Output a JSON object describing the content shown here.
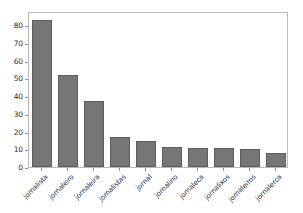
{
  "chart_data": {
    "type": "bar",
    "title": "",
    "subtitle": "",
    "xlabel": "",
    "ylabel": "",
    "categories": [
      "jornalista",
      "jornaleiro",
      "jornaleira",
      "jornalistas",
      "jornal",
      "jornalino",
      "jornaleca",
      "jornalixos",
      "jornaleiros",
      "jornalerca"
    ],
    "values": [
      83,
      52,
      37.5,
      17,
      14.5,
      11.5,
      10.5,
      10.5,
      10,
      8
    ],
    "series": [
      {
        "name": "count",
        "values": [
          83,
          52,
          37.5,
          17,
          14.5,
          11.5,
          10.5,
          10.5,
          10,
          8
        ]
      }
    ],
    "ylim": [
      0,
      88
    ],
    "yticks": [
      0,
      10,
      20,
      30,
      40,
      50,
      60,
      70,
      80
    ],
    "ytick_labels": [
      "0",
      "10",
      "20",
      "30",
      "40",
      "50",
      "60",
      "70",
      "80"
    ],
    "xtick_rotation": -45,
    "grid": false,
    "legend": false,
    "legend_position": "none",
    "bar_color": "#767676",
    "bar_edge_color": "#5d5d5d",
    "axes_color": "#b9b9b9",
    "background_color": "#ffffff",
    "text_color": "#1f1f1f"
  }
}
